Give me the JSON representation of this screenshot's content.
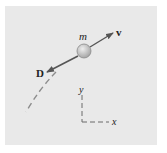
{
  "diagram": {
    "panel_color": "#e9e9e9",
    "labels": {
      "mass": "m",
      "velocity": "v",
      "drag": "D",
      "y_axis": "y",
      "x_axis": "x"
    },
    "colors": {
      "ball_fill": "#c4c4c4",
      "ball_stroke": "#8a8a8a",
      "arrow": "#555555",
      "trajectory": "#8c8c8c",
      "axes": "#6a6a6a",
      "text": "#222222"
    }
  }
}
